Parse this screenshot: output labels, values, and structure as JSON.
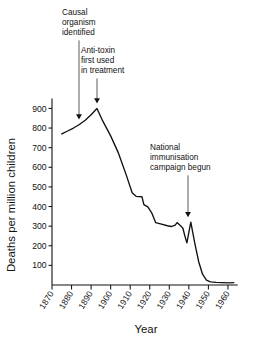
{
  "chart_data": {
    "type": "line",
    "title": "",
    "xlabel": "Year",
    "ylabel": "Deaths per million children",
    "xlim": [
      1870,
      1965
    ],
    "ylim": [
      0,
      950
    ],
    "grid": false,
    "legend": "none",
    "x_ticks": [
      "1870",
      "1880",
      "1890",
      "1900",
      "1910",
      "1920",
      "1930",
      "1940",
      "1950",
      "1960"
    ],
    "y_ticks": [
      "100",
      "200",
      "300",
      "400",
      "500",
      "600",
      "700",
      "800",
      "900"
    ],
    "series": [
      {
        "name": "Deaths per million children",
        "color": "#111111",
        "points": [
          [
            1875,
            770
          ],
          [
            1878,
            785
          ],
          [
            1881,
            800
          ],
          [
            1884,
            818
          ],
          [
            1887,
            840
          ],
          [
            1890,
            868
          ],
          [
            1893,
            900
          ],
          [
            1896,
            835
          ],
          [
            1900,
            760
          ],
          [
            1904,
            672
          ],
          [
            1908,
            560
          ],
          [
            1911,
            470
          ],
          [
            1913,
            452
          ],
          [
            1916,
            450
          ],
          [
            1917,
            410
          ],
          [
            1919,
            398
          ],
          [
            1921,
            368
          ],
          [
            1923,
            318
          ],
          [
            1926,
            310
          ],
          [
            1929,
            302
          ],
          [
            1931,
            298
          ],
          [
            1933,
            305
          ],
          [
            1934,
            318
          ],
          [
            1936,
            300
          ],
          [
            1937,
            288
          ],
          [
            1938,
            248
          ],
          [
            1939,
            215
          ],
          [
            1940,
            268
          ],
          [
            1941,
            320
          ],
          [
            1943,
            215
          ],
          [
            1945,
            120
          ],
          [
            1947,
            55
          ],
          [
            1949,
            25
          ],
          [
            1951,
            16
          ],
          [
            1954,
            13
          ],
          [
            1957,
            12
          ],
          [
            1961,
            11
          ],
          [
            1963,
            12
          ]
        ]
      }
    ],
    "annotations": [
      {
        "id": "causal-organism",
        "lines": [
          "Causal",
          "organism",
          "identified"
        ],
        "target_year": 1884,
        "target_value": 818
      },
      {
        "id": "anti-toxin",
        "lines": [
          "Anti-toxin",
          "first used",
          "in treatment"
        ],
        "target_year": 1893,
        "target_value": 900
      },
      {
        "id": "national-immunisation",
        "lines": [
          "National",
          "immunisation",
          "campaign begun"
        ],
        "target_year": 1941,
        "target_value": 320
      }
    ]
  },
  "caption": {
    "partial_text": ""
  }
}
